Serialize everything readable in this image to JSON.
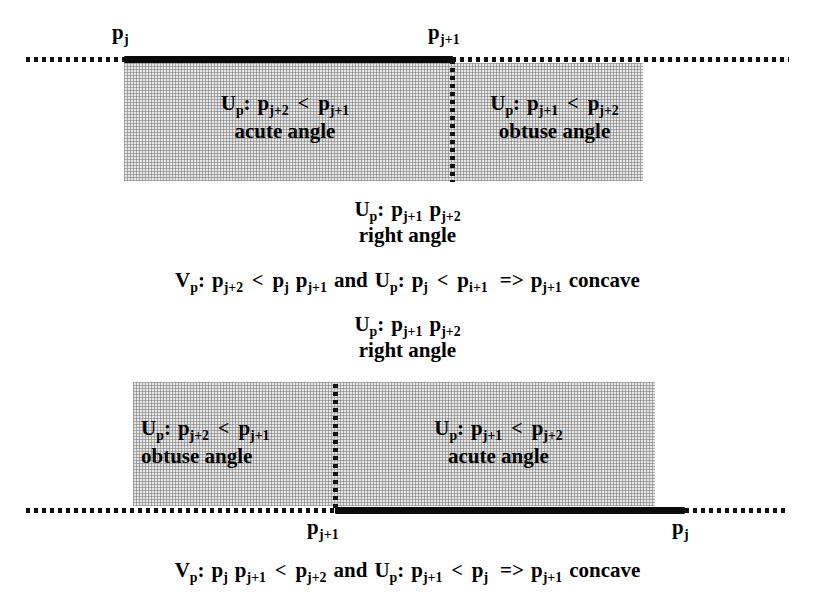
{
  "figure": {
    "accent_color": "#0a0a0a",
    "shade_color": "#e6e6e6"
  },
  "top_diagram": {
    "point_label_left": "pj",
    "point_label_left_base": "p",
    "point_label_left_sub": "j",
    "point_label_right_base": "p",
    "point_label_right_sub": "j+1",
    "left_cell": {
      "condition_prefix_base": "U",
      "condition_prefix_sub": "p",
      "condition_colon": ":",
      "lhs_base": "p",
      "lhs_sub": "j+2",
      "operator": "<",
      "rhs_base": "p",
      "rhs_sub": "j+1",
      "angle_label": "acute angle"
    },
    "right_cell": {
      "condition_prefix_base": "U",
      "condition_prefix_sub": "p",
      "condition_colon": ":",
      "lhs_base": "p",
      "lhs_sub": "j+1",
      "operator": "<",
      "rhs_base": "p",
      "rhs_sub": "j+2",
      "angle_label": "obtuse angle"
    }
  },
  "top_middle_note": {
    "prefix_base": "U",
    "prefix_sub": "p",
    "colon": ":",
    "first_base": "p",
    "first_sub": "j+1",
    "second_base": "p",
    "second_sub": "j+2",
    "angle_label": "right angle"
  },
  "top_conclusion": {
    "v_base": "V",
    "v_sub": "p",
    "colon1": ":",
    "a_base": "p",
    "a_sub": "j+2",
    "op1": "<",
    "b_base": "p",
    "b_sub": "j",
    "c_base": "p",
    "c_sub": "j+1",
    "conj": "and",
    "u_base": "U",
    "u_sub": "p",
    "colon2": ":",
    "d_base": "p",
    "d_sub": "j",
    "op2": "<",
    "e_base": "p",
    "e_sub": "i+1",
    "implies": "=>",
    "f_base": "p",
    "f_sub": "j+1",
    "result": "concave"
  },
  "bottom_middle_note": {
    "prefix_base": "U",
    "prefix_sub": "p",
    "colon": ":",
    "first_base": "p",
    "first_sub": "j+1",
    "second_base": "p",
    "second_sub": "j+2",
    "angle_label": "right angle"
  },
  "bottom_diagram": {
    "point_label_left_base": "p",
    "point_label_left_sub": "j+1",
    "point_label_right_base": "p",
    "point_label_right_sub": "j",
    "left_cell": {
      "condition_prefix_base": "U",
      "condition_prefix_sub": "p",
      "condition_colon": ":",
      "lhs_base": "p",
      "lhs_sub": "j+2",
      "operator": "<",
      "rhs_base": "p",
      "rhs_sub": "j+1",
      "angle_label": "obtuse angle"
    },
    "right_cell": {
      "condition_prefix_base": "U",
      "condition_prefix_sub": "p",
      "condition_colon": ":",
      "lhs_base": "p",
      "lhs_sub": "j+1",
      "operator": "<",
      "rhs_base": "p",
      "rhs_sub": "j+2",
      "angle_label": "acute angle"
    }
  },
  "bottom_conclusion": {
    "v_base": "V",
    "v_sub": "p",
    "colon1": ":",
    "a_base": "p",
    "a_sub": "j",
    "b_base": "p",
    "b_sub": "j+1",
    "op1": "<",
    "c_base": "p",
    "c_sub": "j+2",
    "conj": "and",
    "u_base": "U",
    "u_sub": "p",
    "colon2": ":",
    "d_base": "p",
    "d_sub": "j+1",
    "op2": "<",
    "e_base": "p",
    "e_sub": "j",
    "implies": "=>",
    "f_base": "p",
    "f_sub": "j+1",
    "result": "concave"
  }
}
